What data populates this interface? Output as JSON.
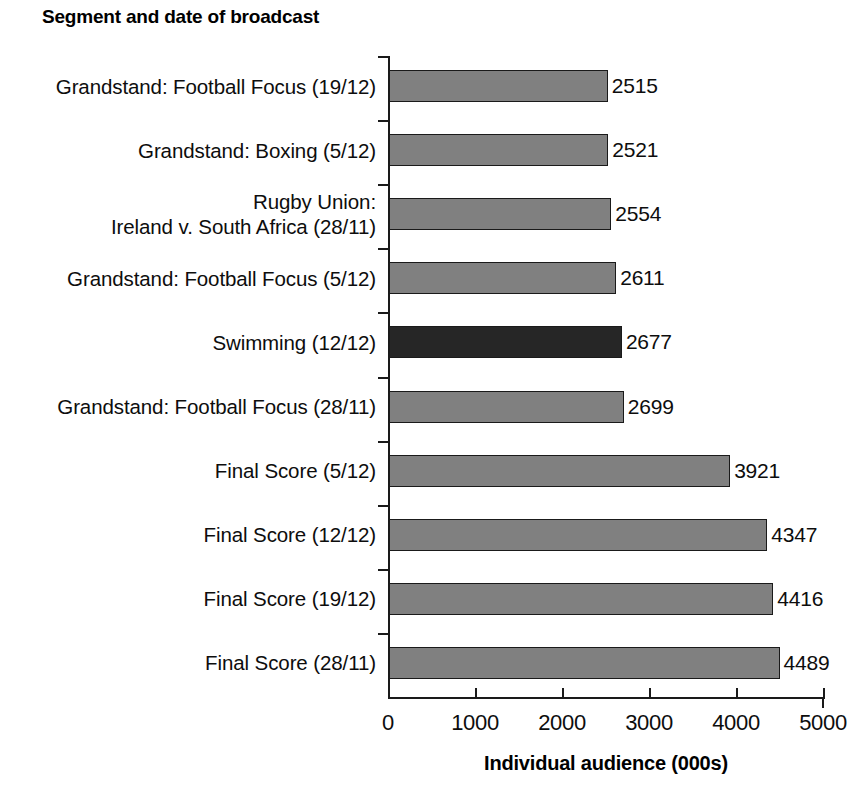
{
  "chart_data": {
    "type": "bar",
    "orientation": "horizontal",
    "title": "Segment and date of broadcast",
    "xlabel": "Individual audience (000s)",
    "ylabel": "Segment and date of broadcast",
    "xlim": [
      0,
      5000
    ],
    "xticks": [
      0,
      1000,
      2000,
      3000,
      4000,
      5000
    ],
    "xtick_labels": [
      "0",
      "1000",
      "2000",
      "3000",
      "4000",
      "5000"
    ],
    "grid": false,
    "legend": false,
    "value_labels": true,
    "categories": [
      "Grandstand: Football Focus (19/12)",
      "Grandstand: Boxing (5/12)",
      "Rugby Union:\nIreland v. South Africa (28/11)",
      "Grandstand: Football Focus (5/12)",
      "Swimming (12/12)",
      "Grandstand: Football Focus (28/11)",
      "Final Score (5/12)",
      "Final Score (12/12)",
      "Final Score (19/12)",
      "Final Score (28/11)"
    ],
    "values": [
      2515,
      2521,
      2554,
      2611,
      2677,
      2699,
      3921,
      4347,
      4416,
      4489
    ],
    "value_label_texts": [
      "2515",
      "2521",
      "2554",
      "2611",
      "2677",
      "2699",
      "3921",
      "4347",
      "4416",
      "4489"
    ],
    "bar_colors": [
      "#808080",
      "#808080",
      "#808080",
      "#808080",
      "#262626",
      "#808080",
      "#808080",
      "#808080",
      "#808080",
      "#808080"
    ],
    "highlight_index": 4,
    "highlight_category": "Swimming (12/12)",
    "colors": {
      "bar_default": "#808080",
      "bar_highlight": "#262626",
      "bar_outline": "#1a1a1a",
      "axis": "#1a1a1a",
      "text": "#0d0d0d",
      "background": "#ffffff"
    }
  }
}
